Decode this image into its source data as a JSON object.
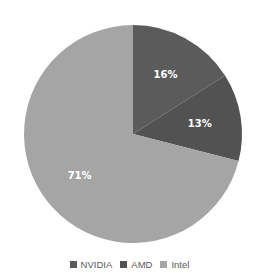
{
  "chart_data": {
    "type": "pie",
    "title": "",
    "categories": [
      "NVIDIA",
      "AMD",
      "Intel"
    ],
    "values": [
      16,
      13,
      71
    ],
    "labels": [
      "16%",
      "13%",
      "71%"
    ],
    "colors": [
      "#5b5b5b",
      "#525252",
      "#a5a5a5"
    ],
    "start_angle_deg": 0,
    "direction": "clockwise",
    "legend_position": "bottom"
  },
  "legend": [
    {
      "label": "NVIDIA",
      "color": "#5b5b5b"
    },
    {
      "label": "AMD",
      "color": "#525252"
    },
    {
      "label": "Intel",
      "color": "#a5a5a5"
    }
  ]
}
